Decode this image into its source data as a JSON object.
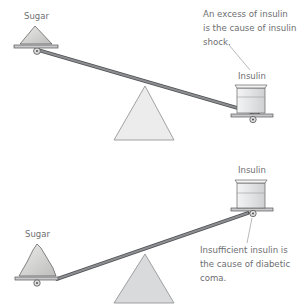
{
  "colors": {
    "beam": "#7d7f82",
    "beam_edge": "#4d4f52",
    "fulcrum_fill": "#ececed",
    "fulcrum_stroke": "#8a8c8f",
    "sugar_fill": "#d6d6d4",
    "pan_fill": "#c9cacc",
    "beaker_fill": "#e4e5e6",
    "text": "#6d6e71"
  },
  "top_scale": {
    "left_label": "Sugar",
    "right_label": "Insulin",
    "annotation": [
      "An excess of insulin",
      "is the cause of insulin",
      "shock."
    ]
  },
  "bottom_scale": {
    "left_label": "Sugar",
    "right_label": "Insulin",
    "annotation": [
      "Insufficient insulin is",
      "the cause of diabetic",
      "coma."
    ]
  }
}
